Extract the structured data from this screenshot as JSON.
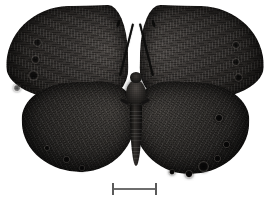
{
  "image": {
    "kind": "specimen-photograph",
    "subject": "butterfly",
    "view": "dorsal",
    "background_color": "#ffffff",
    "width_px": 269,
    "height_px": 208
  },
  "specimen": {
    "overall_color": "#2a2724",
    "darkest_color": "#090908",
    "highlight_color": "#4a4643",
    "parts": {
      "forewing_left": "forewing-left",
      "forewing_right": "forewing-right",
      "hindwing_left": "hindwing-left",
      "hindwing_right": "hindwing-right",
      "head": "head",
      "thorax": "thorax",
      "abdomen": "abdomen",
      "antenna_left": "antenna-left",
      "antenna_right": "antenna-right"
    },
    "ocelli": {
      "forewing_left_count": 4,
      "forewing_right_count": 3,
      "hindwing_left_count": 3,
      "hindwing_right_count": 6,
      "color": "#060606"
    }
  },
  "scale_bar": {
    "label": "",
    "x_px": 112,
    "y_px": 183,
    "length_px": 45,
    "line_color": "#6e6e6e",
    "cap_color": "#5a5a5a"
  }
}
